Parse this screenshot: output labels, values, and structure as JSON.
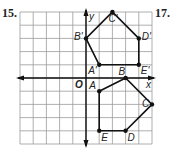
{
  "problems": [
    {
      "number": "15."
    },
    {
      "number": "17."
    }
  ],
  "graph": {
    "origin_label": "O",
    "x_axis_label": "x",
    "y_axis_label": "y",
    "grid_range": {
      "xmin": -5,
      "xmax": 5,
      "ymin": -5,
      "ymax": 5
    },
    "polygon_preimage": {
      "name": "ABCDE",
      "vertices": [
        {
          "label": "A",
          "x": 1,
          "y": -1
        },
        {
          "label": "B",
          "x": 3,
          "y": 0
        },
        {
          "label": "C",
          "x": 5,
          "y": -2
        },
        {
          "label": "D",
          "x": 3,
          "y": -4
        },
        {
          "label": "E",
          "x": 1,
          "y": -4
        }
      ]
    },
    "polygon_image": {
      "name": "A'B'C'D'E'",
      "vertices": [
        {
          "label": "A'",
          "x": 1,
          "y": 1
        },
        {
          "label": "B'",
          "x": 0,
          "y": 3
        },
        {
          "label": "C'",
          "x": 2,
          "y": 5
        },
        {
          "label": "D'",
          "x": 4,
          "y": 3
        },
        {
          "label": "E'",
          "x": 4,
          "y": 1
        }
      ]
    }
  }
}
